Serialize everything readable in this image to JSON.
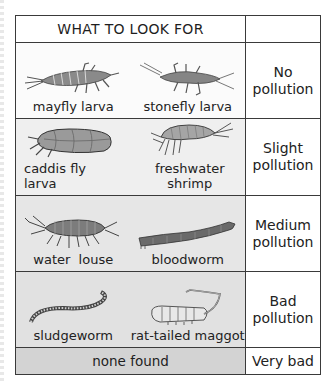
{
  "table": {
    "header": {
      "title": "WHAT TO LOOK FOR",
      "right": ""
    },
    "rows": [
      {
        "creatures": [
          {
            "name": "mayfly larva",
            "icon": "mayfly-larva-icon"
          },
          {
            "name": "stonefly larva",
            "icon": "stonefly-larva-icon"
          }
        ],
        "level_line1": "No",
        "level_line2": "pollution",
        "shade": "#fbfbfb"
      },
      {
        "creatures": [
          {
            "name_line1": "caddis fly",
            "name_line2": "larva",
            "icon": "caddis-fly-larva-icon"
          },
          {
            "name": "freshwater shrimp",
            "icon": "freshwater-shrimp-icon"
          }
        ],
        "level_line1": "Slight",
        "level_line2": "pollution",
        "shade": "#efefef"
      },
      {
        "creatures": [
          {
            "name": "water  louse",
            "icon": "water-louse-icon"
          },
          {
            "name": "bloodworm",
            "icon": "bloodworm-icon"
          }
        ],
        "level_line1": "Medium",
        "level_line2": "pollution",
        "shade": "#e6e6e6"
      },
      {
        "creatures": [
          {
            "name": "sludgeworm",
            "icon": "sludgeworm-icon"
          },
          {
            "name": "rat-tailed maggot",
            "icon": "rat-tailed-maggot-icon"
          }
        ],
        "level_line1": "Bad",
        "level_line2": "pollution",
        "shade": "#e1e1e1"
      },
      {
        "none_label": "none found",
        "level": "Very bad",
        "shade": "#d3d3d3"
      }
    ]
  },
  "colors": {
    "border": "#3a3a3a",
    "text": "#222222",
    "illustration": "#555555"
  }
}
